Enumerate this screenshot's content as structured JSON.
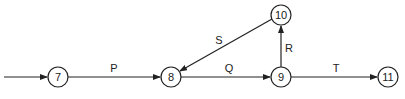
{
  "diagram": {
    "type": "activity-network",
    "nodes": [
      {
        "id": "7",
        "label": "7",
        "x": 58,
        "y": 77
      },
      {
        "id": "8",
        "label": "8",
        "x": 171,
        "y": 77
      },
      {
        "id": "9",
        "label": "9",
        "x": 281,
        "y": 77
      },
      {
        "id": "10",
        "label": "10",
        "x": 281,
        "y": 15
      },
      {
        "id": "11",
        "label": "11",
        "x": 388,
        "y": 77
      }
    ],
    "edges": [
      {
        "from": "start",
        "to": "7",
        "label": ""
      },
      {
        "from": "7",
        "to": "8",
        "label": "P"
      },
      {
        "from": "8",
        "to": "9",
        "label": "Q"
      },
      {
        "from": "9",
        "to": "10",
        "label": "R"
      },
      {
        "from": "10",
        "to": "8",
        "label": "S"
      },
      {
        "from": "9",
        "to": "11",
        "label": "T"
      }
    ],
    "colors": {
      "stroke": "#222222",
      "background": "#ffffff"
    }
  }
}
